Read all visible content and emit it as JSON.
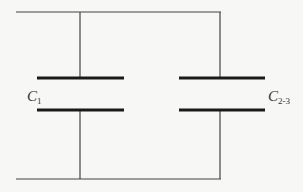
{
  "diagram": {
    "type": "circuit-parallel-capacitors",
    "colors": {
      "wire": "#444444",
      "plate": "#1a1a1a",
      "background": "#f7f7f5"
    },
    "capacitors": [
      {
        "id": "c1",
        "label_main": "C",
        "label_sub": "1"
      },
      {
        "id": "c23",
        "label_main": "C",
        "label_sub": "2-3"
      }
    ]
  }
}
